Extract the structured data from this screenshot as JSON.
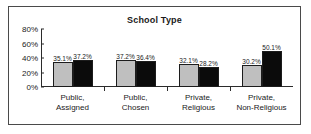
{
  "chart_data": {
    "type": "bar",
    "title": "School Type",
    "xlabel": "",
    "ylabel": "",
    "ylim": [
      0,
      80
    ],
    "ytick_labels": [
      "0%",
      "20%",
      "40%",
      "60%",
      "80%"
    ],
    "ytick_values": [
      0,
      20,
      40,
      60,
      80
    ],
    "grid": false,
    "legend": "none",
    "categories": [
      "Public,\nAssigned",
      "Public,\nChosen",
      "Private,\nReligious",
      "Private,\nNon-Religious"
    ],
    "series": [
      {
        "name": "series-1",
        "color": "#bfbfbf",
        "values": [
          35.1,
          37.2,
          32.1,
          30.2
        ],
        "labels": [
          "35.1%",
          "37.2%",
          "32.1%",
          "30.2%"
        ]
      },
      {
        "name": "series-2",
        "color": "#0b0b0b",
        "values": [
          37.2,
          36.4,
          28.2,
          50.1
        ],
        "labels": [
          "37.2%",
          "36.4%",
          "28.2%",
          "50.1%"
        ]
      }
    ]
  },
  "colors": {
    "frame": "#4a4a4a",
    "axis": "#2b2b2b",
    "text": "#1a1a1a",
    "series_light": "#bfbfbf",
    "series_dark": "#0b0b0b"
  }
}
